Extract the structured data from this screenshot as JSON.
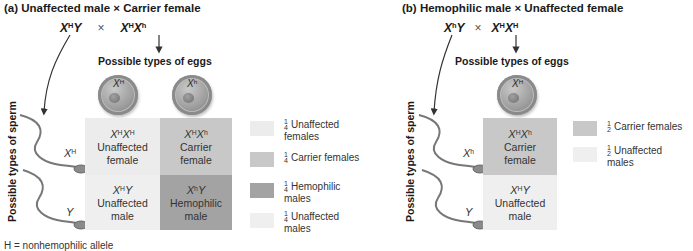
{
  "colors": {
    "unaffected_female": "#ececec",
    "carrier_female": "#c8c8c8",
    "hemophilic_male": "#a3a3a3",
    "unaffected_male": "#efefef"
  },
  "panel_a": {
    "title": "(a) Unaffected male × Carrier female",
    "father": {
      "base": "X",
      "sup": "H",
      "tail": "Y"
    },
    "times": "×",
    "mother": {
      "base": "X",
      "sup": "H",
      "base2": "X",
      "sup2": "h"
    },
    "eggs_label": "Possible types of eggs",
    "sperm_label": "Possible types of sperm",
    "eggs": [
      {
        "base": "X",
        "sup": "H"
      },
      {
        "base": "X",
        "sup": "h"
      }
    ],
    "sperm": [
      {
        "base": "X",
        "sup": "H"
      },
      {
        "base": "Y",
        "sup": ""
      }
    ],
    "grid": [
      [
        {
          "g1": "X",
          "s1": "H",
          "g2": "X",
          "s2": "H",
          "line1": "Unaffected",
          "line2": "female"
        },
        {
          "g1": "X",
          "s1": "H",
          "g2": "X",
          "s2": "h",
          "line1": "Carrier",
          "line2": "female"
        }
      ],
      [
        {
          "g1": "X",
          "s1": "H",
          "g2": "Y",
          "s2": "",
          "line1": "Unaffected",
          "line2": "male"
        },
        {
          "g1": "X",
          "s1": "h",
          "g2": "Y",
          "s2": "",
          "line1": "Hemophilic",
          "line2": "male"
        }
      ]
    ],
    "legend": [
      {
        "num": "1",
        "den": "4",
        "line1": "Unaffected",
        "line2": "females"
      },
      {
        "num": "1",
        "den": "4",
        "line1": "Carrier females",
        "line2": ""
      },
      {
        "num": "1",
        "den": "4",
        "line1": "Hemophilic",
        "line2": "males"
      },
      {
        "num": "1",
        "den": "4",
        "line1": "Unaffected",
        "line2": "males"
      }
    ]
  },
  "panel_b": {
    "title": "(b) Hemophilic male × Unaffected female",
    "father": {
      "base": "X",
      "sup": "h",
      "tail": "Y"
    },
    "times": "×",
    "mother": {
      "base": "X",
      "sup": "H",
      "base2": "X",
      "sup2": "H"
    },
    "eggs_label": "Possible types of eggs",
    "sperm_label": "Possible types of sperm",
    "eggs": [
      {
        "base": "X",
        "sup": "H"
      }
    ],
    "sperm": [
      {
        "base": "X",
        "sup": "h"
      },
      {
        "base": "Y",
        "sup": ""
      }
    ],
    "grid": [
      [
        {
          "g1": "X",
          "s1": "H",
          "g2": "X",
          "s2": "h",
          "line1": "Carrier",
          "line2": "female"
        }
      ],
      [
        {
          "g1": "X",
          "s1": "H",
          "g2": "Y",
          "s2": "",
          "line1": "Unaffected",
          "line2": "male"
        }
      ]
    ],
    "legend": [
      {
        "num": "1",
        "den": "2",
        "line1": "Carrier females",
        "line2": ""
      },
      {
        "num": "1",
        "den": "2",
        "line1": "Unaffected",
        "line2": "males"
      }
    ]
  },
  "footer": "H = nonhemophilic allele"
}
